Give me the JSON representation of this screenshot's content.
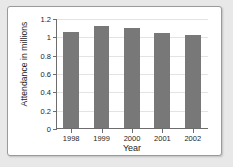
{
  "chart_data": {
    "type": "bar",
    "title": "",
    "xlabel": "Year",
    "ylabel": "Attendance in millions",
    "categories": [
      "1998",
      "1999",
      "2000",
      "2001",
      "2002"
    ],
    "values": [
      1.05,
      1.11,
      1.09,
      1.04,
      1.01
    ],
    "ylim": [
      0,
      1.2
    ],
    "yticks": [
      0,
      0.2,
      0.4,
      0.6,
      0.8,
      1,
      1.2
    ],
    "ytick_labels": [
      "0",
      "0.2",
      "0.4",
      "0.6",
      "0.8",
      "1",
      "1.2"
    ],
    "grid": true,
    "legend": false,
    "bar_color": "#787878",
    "axis_color": "#6d6d6d",
    "grid_color": "#e3e3e3",
    "background_color": "#ffffff",
    "page_background_color": "#e8e8e8"
  }
}
